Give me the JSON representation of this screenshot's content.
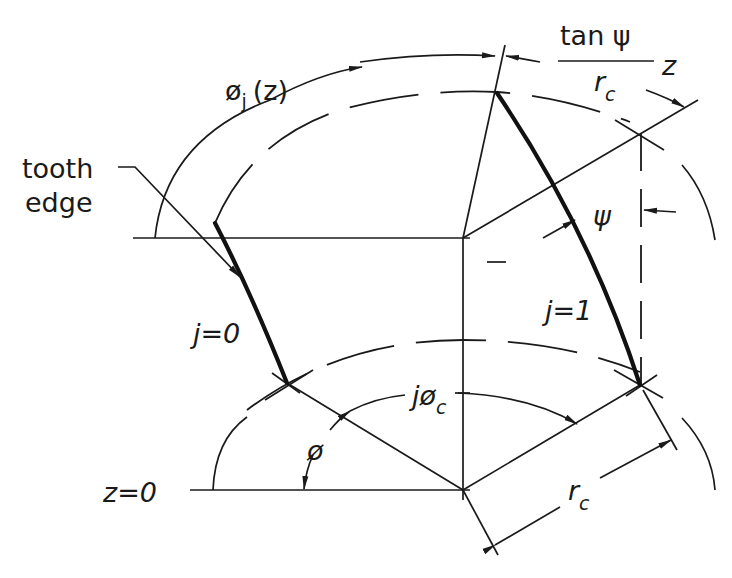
{
  "figure": {
    "labels": {
      "phi_j_z": "ø",
      "phi_j_z_sub": "j",
      "phi_j_z_arg": "(z)",
      "tooth_edge_line1": "tooth",
      "tooth_edge_line2": "edge",
      "tan_psi": "tan ψ",
      "r_c_frac": "r",
      "r_c_frac_sub": "c",
      "z_frac": "z",
      "psi": "ψ",
      "j0": "j=0",
      "j1": "j=1",
      "j_phi_c": "jø",
      "j_phi_c_sub": "c",
      "phi": "ø",
      "z0": "z=0",
      "r_c": "r",
      "r_c_sub": "c",
      "minus": "–"
    },
    "colors": {
      "line": "#1a1a1a",
      "background": "#ffffff"
    }
  }
}
